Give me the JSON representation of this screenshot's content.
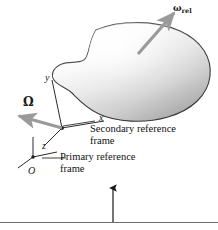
{
  "figure": {
    "background_color": "#ffffff",
    "line_color": "#1a1a1a",
    "arrow_color": "#9a9a9a",
    "body_fill_light": "#fdfdfd",
    "body_fill_dark": "#9d9d9d"
  },
  "labels": {
    "omega_rel": "ω",
    "omega_rel_subscript": "rel",
    "omega_big": "Ω",
    "axis_x": "x",
    "axis_y": "y",
    "axis_z": "z",
    "origin": "O",
    "secondary_frame_line1": "Secondary reference",
    "secondary_frame_line2": "frame",
    "primary_frame_line1": "Primary reference",
    "primary_frame_line2": "frame"
  },
  "annotations": {
    "body_shape": "kidney-shaped rigid body with shaded gradient",
    "omega_rel_vector": "relative angular velocity arrow through the body, pointing up-right",
    "omega_vector": "frame angular velocity arrow at secondary origin, pointing down-left",
    "callout_arrow": "vertical leader arrow pointing up from the bottom rule",
    "bottom_rule": "horizontal separator line across the figure base"
  }
}
